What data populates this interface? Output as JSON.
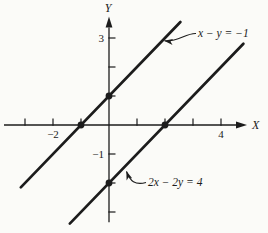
{
  "figure": {
    "background": "#fbfbf8",
    "ink": "#1c1c1c"
  },
  "axes": {
    "x_label": "X",
    "y_label": "Y",
    "x_ticks": [
      -3,
      -2,
      -1,
      1,
      2,
      3,
      4
    ],
    "y_ticks": [
      -3,
      -2,
      -1,
      1,
      2,
      3
    ],
    "x_tick_labels": [
      {
        "value": -2,
        "label": "−2"
      },
      {
        "value": 4,
        "label": "4"
      }
    ],
    "y_tick_labels": [
      {
        "value": 3,
        "label": "3"
      },
      {
        "value": -1,
        "label": "−1"
      }
    ]
  },
  "chart_data": {
    "type": "line",
    "title": "",
    "xlabel": "X",
    "ylabel": "Y",
    "xlim": [
      -3.75,
      5
    ],
    "ylim": [
      -3.35,
      3.7
    ],
    "grid": false,
    "legend": "none",
    "series": [
      {
        "name": "x − y = −1",
        "equation": "y = x + 1",
        "slope": 1,
        "intercept": 1,
        "x_range": [
          -3.15,
          2.55
        ],
        "marked_points": [
          [
            -1,
            0
          ],
          [
            0,
            1
          ]
        ]
      },
      {
        "name": "2x − 2y = 4",
        "equation": "y = x − 2",
        "slope": 1,
        "intercept": -2,
        "x_range": [
          -1.4,
          4.8
        ],
        "marked_points": [
          [
            2,
            0
          ],
          [
            0,
            -2
          ]
        ]
      }
    ],
    "annotations": [
      {
        "text": "x − y = −1",
        "series": 0,
        "label_px": [
          198,
          37
        ],
        "arrow_path": "M 196 33.5 C 186 33 177 42.5 164.5 40.8"
      },
      {
        "text": "2x − 2y = 4",
        "series": 1,
        "label_px": [
          148,
          186
        ],
        "arrow_path": "M 146 182.5 C 135 185.5 130 181 126.5 171.5"
      }
    ]
  }
}
